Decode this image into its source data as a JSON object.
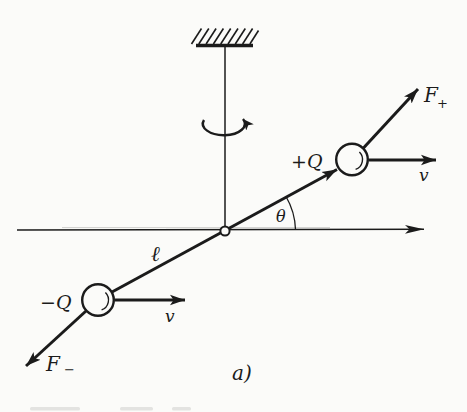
{
  "figure": {
    "caption": "a)"
  },
  "colors": {
    "ink": "#1b1b1b",
    "paper": "#fbfbf9"
  },
  "labels": {
    "force_positive": {
      "main": "F",
      "sub": "+"
    },
    "force_negative": {
      "main": "F",
      "sub": "−"
    },
    "charge_positive": "+Q",
    "charge_negative": "−Q",
    "velocity_upper": "v",
    "velocity_lower": "v",
    "rod_length": "ℓ",
    "angle": "θ"
  }
}
